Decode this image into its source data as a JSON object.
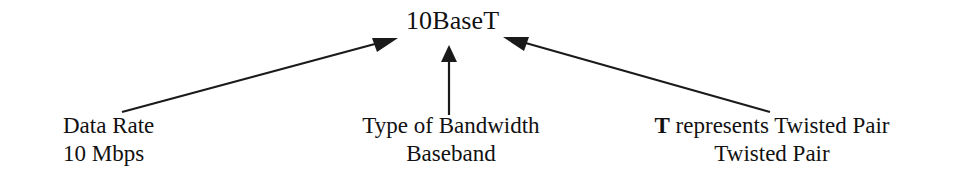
{
  "diagram": {
    "type": "annotated-term-breakdown",
    "title_node": {
      "text": "10BaseT"
    },
    "labels": [
      {
        "id": "data-rate",
        "line1": "Data Rate",
        "line2": "10 Mbps",
        "align": "left"
      },
      {
        "id": "bandwidth-type",
        "line1": "Type of Bandwidth",
        "line2": "Baseband",
        "align": "center"
      },
      {
        "id": "twisted-pair",
        "bold_prefix": "T",
        "line1_rest": " represents Twisted Pair",
        "line2": "Twisted Pair",
        "align": "center"
      }
    ],
    "arrows": [
      {
        "id": "arrow-left",
        "from": [
          122,
          112
        ],
        "to": [
          398,
          38
        ],
        "direction": "up-right"
      },
      {
        "id": "arrow-middle",
        "from": [
          449,
          115
        ],
        "to": [
          449,
          46
        ],
        "direction": "up"
      },
      {
        "id": "arrow-right",
        "from": [
          770,
          112
        ],
        "to": [
          503,
          37
        ],
        "direction": "up-left"
      }
    ],
    "colors": {
      "background": "#ffffff",
      "ink": "#111111",
      "stroke": "#1a1a1a"
    }
  }
}
